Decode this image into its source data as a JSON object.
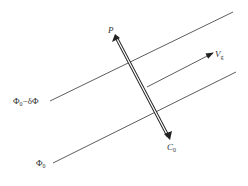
{
  "diagram": {
    "labels": {
      "p": "P",
      "v": "V",
      "v_sub": "g",
      "c": "C",
      "c_sub": "0",
      "phi_upper": "Φ",
      "phi_upper_sub": "0",
      "phi_upper_rest": "−δΦ",
      "phi_lower": "Φ",
      "phi_lower_sub": "0"
    },
    "colors": {
      "line": "#333333",
      "background": "#ffffff"
    }
  }
}
